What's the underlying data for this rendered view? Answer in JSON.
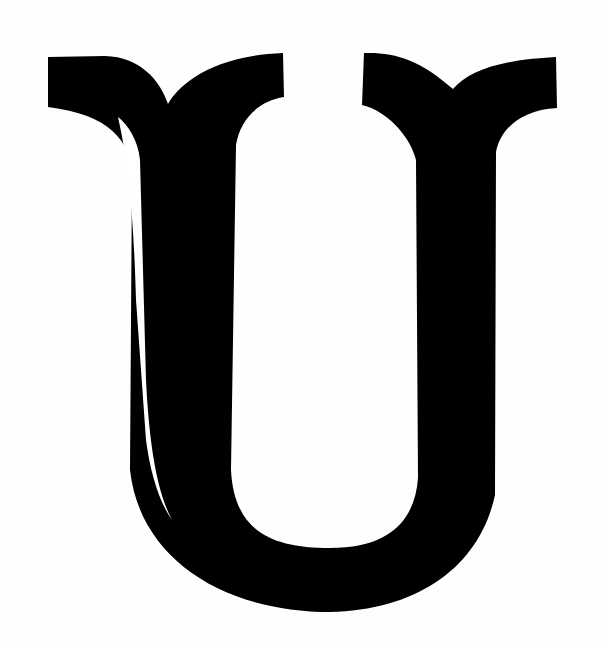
{
  "image": {
    "subject": "Decorative serif capital letter U",
    "letter": "U",
    "background_color": "#fefefe",
    "glyph_color": "#000000",
    "inline_stroke_color": "#ffffff"
  }
}
